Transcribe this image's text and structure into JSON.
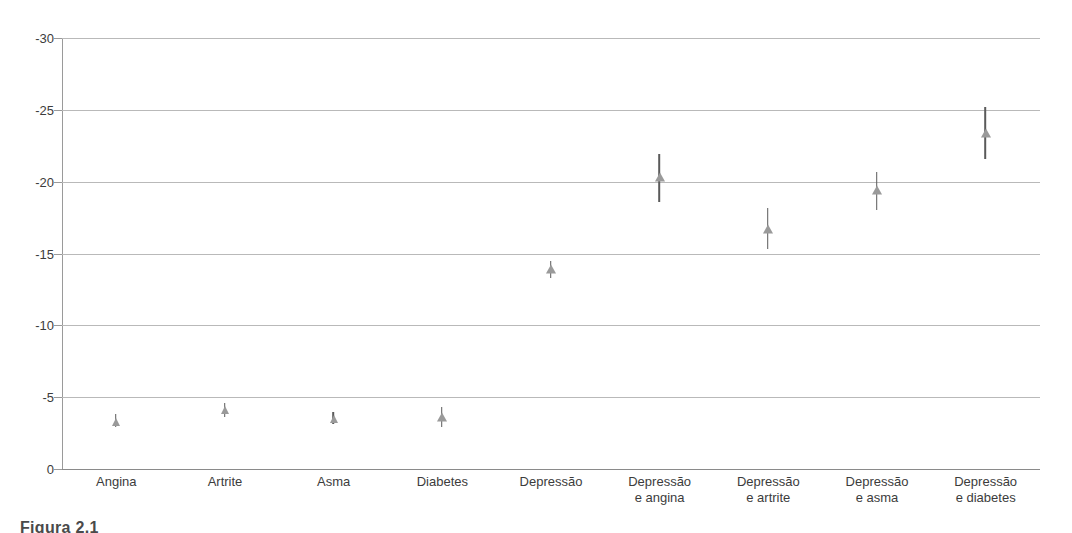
{
  "caption": "Figura 2.1",
  "axis": {
    "y_ticks": [
      "-30",
      "-25",
      "-20",
      "-15",
      "-10",
      "-5",
      "0"
    ],
    "y_tick_values": [
      -30,
      -25,
      -20,
      -15,
      -10,
      -5,
      0
    ]
  },
  "chart_data": {
    "type": "scatter",
    "title": "",
    "subtitle": "",
    "xlabel": "",
    "ylabel": "",
    "ylim": [
      -30,
      0
    ],
    "y_inverted": true,
    "grid": true,
    "legend": null,
    "marker_shape": "triangle",
    "marker_color": "#9a9a9a",
    "errorbar_color": "#5a5a5a",
    "categories": [
      "Angina",
      "Artrite",
      "Asma",
      "Diabetes",
      "Depressão",
      "Depressão e angina",
      "Depressão e artrite",
      "Depressão e asma",
      "Depressão e diabetes"
    ],
    "category_lines": [
      [
        "Angina",
        ""
      ],
      [
        "Artrite",
        ""
      ],
      [
        "Asma",
        ""
      ],
      [
        "Diabetes",
        ""
      ],
      [
        "Depressão",
        ""
      ],
      [
        "Depressão",
        "e angina"
      ],
      [
        "Depressão",
        "e artrite"
      ],
      [
        "Depressão",
        "e asma"
      ],
      [
        "Depressão",
        "e diabetes"
      ]
    ],
    "values": [
      -3.3,
      -4.1,
      -3.5,
      -3.6,
      -13.9,
      -20.3,
      -16.7,
      -19.4,
      -23.4
    ],
    "ci_low": [
      -2.9,
      -3.6,
      -3.1,
      -2.9,
      -13.3,
      -18.6,
      -15.3,
      -18.0,
      -21.6
    ],
    "ci_high": [
      -3.8,
      -4.6,
      -4.0,
      -4.3,
      -14.5,
      -21.9,
      -18.2,
      -20.7,
      -25.2
    ],
    "series": [
      {
        "name": "Decréscimo na pontuação de saúde",
        "values": [
          -3.3,
          -4.1,
          -3.5,
          -3.6,
          -13.9,
          -20.3,
          -16.7,
          -19.4,
          -23.4
        ]
      }
    ]
  }
}
